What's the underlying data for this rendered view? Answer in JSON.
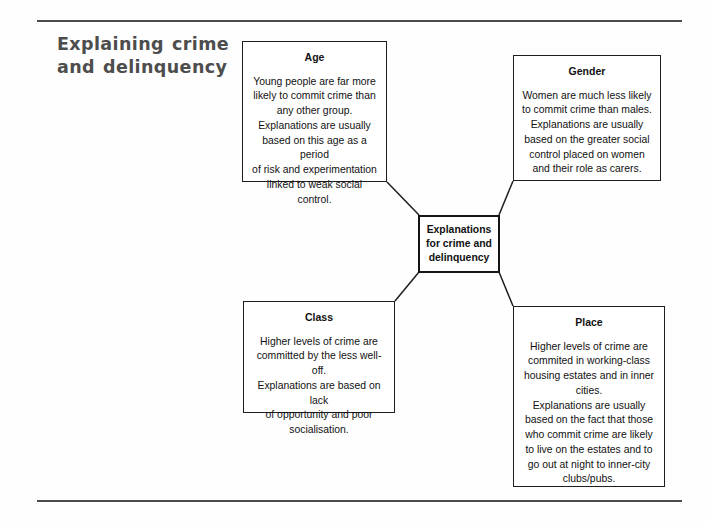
{
  "page": {
    "title_lines": [
      "Explaining crime",
      "and delinquency"
    ],
    "title_full": "Explaining crime and delinquency"
  },
  "diagram": {
    "type": "concept-map",
    "centre": {
      "id": "centre",
      "label": "Explanations\nfor crime and\ndelinquency"
    },
    "nodes": [
      {
        "id": "age",
        "title": "Age",
        "body": "Young people are far more\nlikely to commit crime than\nany other group.\nExplanations are usually\nbased on this age as a period\nof risk and experimentation\nlinked to weak social control."
      },
      {
        "id": "gender",
        "title": "Gender",
        "body": "Women are much less likely\nto commit crime than males.\nExplanations are usually\nbased on the greater social\ncontrol placed on women\nand their role as carers."
      },
      {
        "id": "class",
        "title": "Class",
        "body": "Higher levels of crime are\ncommitted by the less well-off.\nExplanations are based on lack\nof opportunity and poor\nsocialisation."
      },
      {
        "id": "place",
        "title": "Place",
        "body": "Higher levels of crime are\ncommited in working-class\nhousing estates and in inner\ncities.\nExplanations are usually\nbased on the fact that those\nwho commit crime are likely\nto live on the estates and to\ngo out at night to inner-city\nclubs/pubs."
      }
    ],
    "connections": [
      {
        "from": "age",
        "to": "centre"
      },
      {
        "from": "gender",
        "to": "centre"
      },
      {
        "from": "centre",
        "to": "class"
      },
      {
        "from": "centre",
        "to": "place"
      }
    ]
  },
  "colors": {
    "rule": "#4a4a4a",
    "title_text": "#4d4d4d",
    "box_border": "#1e1e1e",
    "centre_border": "#151515",
    "body_text": "#111111",
    "background": "#ffffff"
  }
}
